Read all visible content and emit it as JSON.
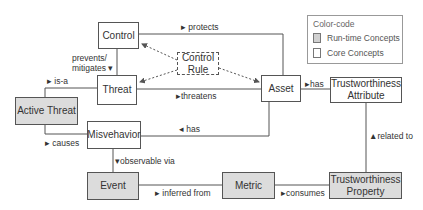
{
  "legend": {
    "title": "Color-code",
    "items": [
      {
        "label": "Run-time Concepts",
        "kind": "runtime"
      },
      {
        "label": "Core Concepts",
        "kind": "core"
      }
    ]
  },
  "nodes": {
    "control": "Control",
    "control_rule": "Control Rule",
    "threat": "Threat",
    "asset": "Asset",
    "trust_attr": "Trustworthiness Attribute",
    "active_threat": "Active Threat",
    "misbehavior": "Misvehavior",
    "event": "Event",
    "metric": "Metric",
    "trust_prop": "Trustworthiness Property"
  },
  "edges": {
    "protects": "▸ protects",
    "prevents": "prevents/",
    "mitigates": "mitigates ▾",
    "is_a": "▸ is-a",
    "threatens": "▸threatens",
    "has_attr": "▸has",
    "has_misb": "◂ has",
    "causes": "▸ causes",
    "observable": "▾observable via",
    "inferred": "▸ inferred from",
    "consumes": "▸consumes",
    "related": "▲related to"
  },
  "colors": {
    "runtime_fill": "#dcdcdc",
    "core_fill": "#ffffff",
    "line": "#555555"
  }
}
